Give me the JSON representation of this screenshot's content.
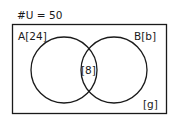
{
  "diagram": {
    "type": "venn",
    "universe_label": "#U = 50",
    "universe_total": 50,
    "sets": [
      {
        "name": "A",
        "label": "A[24]",
        "count": 24
      },
      {
        "name": "B",
        "label": "B[b]",
        "count": "b"
      }
    ],
    "intersection_label": "[8]",
    "intersection_count": 8,
    "outside_label": "[g]",
    "outside_count": "g",
    "colors": {
      "stroke": "#1a1a1a",
      "background": "#ffffff"
    }
  }
}
